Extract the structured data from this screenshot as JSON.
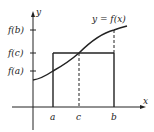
{
  "diagram": {
    "curve_label": "y = f(x)",
    "axes": {
      "x_label": "x",
      "y_label": "y"
    },
    "x_ticks": [
      {
        "label": "a",
        "x": 53
      },
      {
        "label": "c",
        "x": 79
      },
      {
        "label": "b",
        "x": 114
      }
    ],
    "y_ticks": [
      {
        "label": "f(b)",
        "y": 30
      },
      {
        "label": "f(c)",
        "y": 53
      },
      {
        "label": "f(a)",
        "y": 71
      }
    ],
    "colors": {
      "stroke": "#222222",
      "background": "#ffffff"
    }
  }
}
